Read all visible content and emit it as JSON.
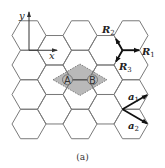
{
  "figure": {
    "caption": "(a)",
    "axes": {
      "x_label": "x",
      "y_label": "y"
    },
    "atoms": {
      "a_label": "A",
      "b_label": "B"
    },
    "neighbor_vectors": [
      {
        "name": "R",
        "sub": "1"
      },
      {
        "name": "R",
        "sub": "2"
      },
      {
        "name": "R",
        "sub": "3"
      }
    ],
    "lattice_vectors": [
      {
        "name": "a",
        "sub": "1"
      },
      {
        "name": "a",
        "sub": "2"
      }
    ],
    "colors": {
      "lattice_line": "#7a7a7a",
      "unit_cell_fill": "#b9b9b9",
      "vector": "#111111",
      "background": "#ffffff"
    }
  }
}
